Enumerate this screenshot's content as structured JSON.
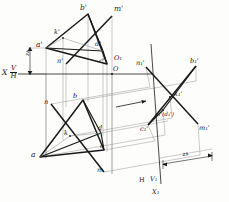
{
  "figure": {
    "background_color": "#fdfdfc",
    "ink_color": "#1a1a1a",
    "thin_color": "#7d7d7d"
  },
  "axes": {
    "x_label": "X",
    "vh_numerator": "V",
    "vh_denominator": "H",
    "origin_label": "O",
    "aux_origin_label": "O₁",
    "aux_h_label": "H",
    "aux_v1_label": "V₁",
    "aux_x1_label": "X₁"
  },
  "dimensions": {
    "z_a_vertical": "zᴀ",
    "z_a_auxiliary": "zᴀ"
  },
  "labels_v_view": [
    {
      "id": "b-prime",
      "text": "b'",
      "x": 80,
      "y": 5
    },
    {
      "id": "m-prime",
      "text": "m'",
      "x": 114,
      "y": 6
    },
    {
      "id": "k-prime",
      "text": "k'",
      "x": 53,
      "y": 32
    },
    {
      "id": "a-prime",
      "text": "a'",
      "x": 35,
      "y": 42
    },
    {
      "id": "d-prime",
      "text": "d'",
      "x": 95,
      "y": 44
    },
    {
      "id": "n-prime",
      "text": "n'",
      "x": 56,
      "y": 60
    },
    {
      "id": "c-prime",
      "text": "c'",
      "x": 100,
      "y": 61
    }
  ],
  "labels_h_view": [
    {
      "id": "n",
      "text": "n",
      "x": 44,
      "y": 100
    },
    {
      "id": "b",
      "text": "b",
      "x": 72,
      "y": 95
    },
    {
      "id": "k",
      "text": "k",
      "x": 64,
      "y": 131
    },
    {
      "id": "d",
      "text": "d",
      "x": 98,
      "y": 128
    },
    {
      "id": "c",
      "text": "c",
      "x": 99,
      "y": 145
    },
    {
      "id": "a",
      "text": "a",
      "x": 31,
      "y": 152
    },
    {
      "id": "m",
      "text": "m",
      "x": 97,
      "y": 168
    }
  ],
  "labels_aux_view": [
    {
      "id": "n1-prime",
      "text": "n₁'",
      "x": 136,
      "y": 62
    },
    {
      "id": "b1-prime",
      "text": "b₁'",
      "x": 190,
      "y": 60
    },
    {
      "id": "k1-prime",
      "text": "k₁'",
      "x": 174,
      "y": 93
    },
    {
      "id": "a1-d1-prime",
      "text": "a₁'(d₁')",
      "x": 158,
      "y": 114
    },
    {
      "id": "c1-prime",
      "text": "c₁'",
      "x": 141,
      "y": 128
    },
    {
      "id": "m1-prime",
      "text": "m₁'",
      "x": 199,
      "y": 127
    }
  ],
  "geometry": {
    "v_view": {
      "a_prime": [
        46,
        48
      ],
      "b_prime": [
        88,
        14
      ],
      "c_prime": [
        107,
        64
      ],
      "d_prime": [
        103,
        51
      ],
      "k_prime": [
        63,
        38
      ],
      "m_prime": [
        112,
        16
      ],
      "n_prime": [
        66,
        64
      ]
    },
    "h_view": {
      "a": [
        40,
        157
      ],
      "b": [
        83,
        100
      ],
      "c": [
        104,
        150
      ],
      "d": [
        101,
        133
      ],
      "k": [
        70,
        136
      ],
      "m": [
        104,
        172
      ],
      "n": [
        51,
        104
      ]
    },
    "aux_view": {
      "n1_prime": [
        146,
        67
      ],
      "b1_prime": [
        196,
        66
      ],
      "k1_prime": [
        170,
        97
      ],
      "a1_prime": [
        163,
        110
      ],
      "c1_prime": [
        148,
        125
      ],
      "m1_prime": [
        198,
        124
      ]
    },
    "ground_line_y": 74,
    "aux_axis": [
      [
        152,
        46
      ],
      [
        160,
        182
      ]
    ]
  },
  "arrow_marker": {
    "name": "view-direction-arrow",
    "from": [
      118,
      106
    ],
    "to": [
      148,
      101
    ]
  }
}
